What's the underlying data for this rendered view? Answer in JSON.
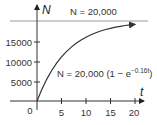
{
  "chart_data": {
    "type": "line",
    "title": "",
    "xlabel": "t",
    "ylabel": "N",
    "xlim": [
      0,
      20
    ],
    "ylim": [
      0,
      20000
    ],
    "x_ticks": [
      "0",
      "5",
      "10",
      "15",
      "20"
    ],
    "y_ticks": [
      "5000",
      "10000",
      "15000"
    ],
    "grid": false,
    "legend": null,
    "series": [
      {
        "name": "N = 20,000 (1 - e^(-0.16t))",
        "x": [
          0,
          1,
          2,
          3,
          4,
          5,
          6,
          7,
          8,
          9,
          10,
          11,
          12,
          13,
          14,
          15,
          16,
          17,
          18,
          19,
          20
        ],
        "values": [
          0,
          2957,
          5476,
          7619,
          9445,
          11013,
          12342,
          13475,
          14439,
          15262,
          15962,
          16557,
          17064,
          17497,
          17865,
          18179,
          18452,
          18684,
          18873,
          19044,
          19185
        ]
      }
    ],
    "asymptote": {
      "label": "N = 20,000",
      "value": 20000
    },
    "annotations": [
      {
        "text_main": "N = 20,000 (1 − e",
        "text_sup": "−0.16t",
        "text_end": ")"
      }
    ],
    "colors": {
      "curve": "#333333",
      "asymptote": "#999999",
      "axis": "#333333"
    }
  }
}
